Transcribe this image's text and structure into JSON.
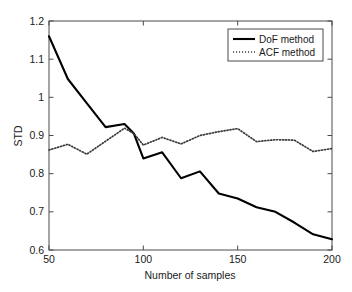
{
  "chart_data": {
    "type": "line",
    "title": "",
    "xlabel": "Number of samples",
    "ylabel": "STD",
    "xlim": [
      50,
      200
    ],
    "ylim": [
      0.6,
      1.2
    ],
    "xticks": [
      50,
      100,
      150,
      200
    ],
    "xtick_labels": [
      "50",
      "100",
      "150",
      "200"
    ],
    "yticks": [
      0.6,
      0.7,
      0.8,
      0.9,
      1.0,
      1.1,
      1.2
    ],
    "ytick_labels": [
      "0.6",
      "0.7",
      "0.8",
      "0.9",
      "1",
      "1.1",
      "1.2"
    ],
    "grid": false,
    "legend_position": "top-right",
    "x": [
      50,
      60,
      70,
      80,
      90,
      95,
      100,
      110,
      120,
      130,
      140,
      150,
      160,
      170,
      180,
      190,
      200
    ],
    "series": [
      {
        "name": "DoF method",
        "style": "solid",
        "color": "#000000",
        "values": [
          1.16,
          1.048,
          0.985,
          0.922,
          0.93,
          0.905,
          0.84,
          0.856,
          0.788,
          0.806,
          0.748,
          0.735,
          0.712,
          0.7,
          0.672,
          0.641,
          0.628
        ]
      },
      {
        "name": "ACF method",
        "style": "dotted",
        "color": "#3a3a3a",
        "values": [
          0.862,
          0.877,
          0.851,
          0.885,
          0.919,
          0.905,
          0.875,
          0.895,
          0.878,
          0.9,
          0.91,
          0.918,
          0.884,
          0.889,
          0.888,
          0.858,
          0.866
        ]
      }
    ]
  },
  "legend": {
    "entries": [
      {
        "label": "DoF method",
        "style": "solid"
      },
      {
        "label": "ACF method",
        "style": "dotted"
      }
    ]
  },
  "axes": {
    "x_label": "Number of samples",
    "y_label": "STD"
  }
}
